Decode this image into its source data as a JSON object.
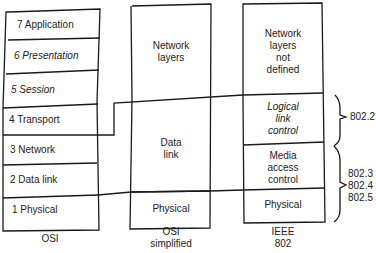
{
  "osi": {
    "caption": "OSI",
    "layers": [
      {
        "label": "7 Application",
        "italic": false
      },
      {
        "label": "6 Presentation",
        "italic": true
      },
      {
        "label": "5 Session",
        "italic": true
      },
      {
        "label": "4 Transport",
        "italic": false
      },
      {
        "label": "3 Network",
        "italic": false
      },
      {
        "label": "2 Data link",
        "italic": false
      },
      {
        "label": "1 Physical",
        "italic": false
      }
    ]
  },
  "osi_simplified": {
    "caption_line1": "OSI",
    "caption_line2": "simplified",
    "blocks": [
      {
        "line1": "Network",
        "line2": "layers"
      },
      {
        "line1": "Data",
        "line2": "link"
      },
      {
        "line1": "Physical"
      }
    ]
  },
  "ieee802": {
    "caption_line1": "IEEE",
    "caption_line2": "802",
    "blocks": [
      {
        "line1": "Network",
        "line2": "layers",
        "line3": "not",
        "line4": "defined"
      },
      {
        "line1": "Logical",
        "line2": "link",
        "line3": "control"
      },
      {
        "line1": "Media",
        "line2": "access",
        "line3": "control"
      },
      {
        "line1": "Physical"
      }
    ]
  },
  "standards": {
    "llc": "802.2",
    "mac": [
      "802.3",
      "802.4",
      "802.5"
    ]
  }
}
